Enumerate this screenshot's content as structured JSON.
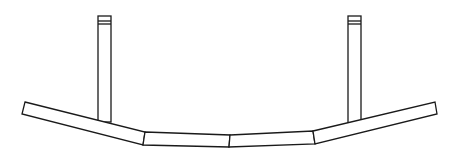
{
  "figure": {
    "stroke_color": "#1a1a1a",
    "background": "#ffffff",
    "segments": [
      {
        "name": "left-end-segment",
        "points": "25,102 145,132 143,145 22,114"
      },
      {
        "name": "center-left-segment",
        "points": "145,132 230,135 229,147 143,145"
      },
      {
        "name": "center-right-segment",
        "points": "230,135 313,131 315,144 229,147"
      },
      {
        "name": "right-end-segment",
        "points": "313,131 435,102 437,114 315,144"
      }
    ],
    "posts": [
      {
        "name": "left-post",
        "x": 98,
        "y": 16,
        "width": 13,
        "height": 106
      },
      {
        "name": "right-post",
        "x": 348,
        "y": 16,
        "width": 13,
        "height": 107
      }
    ]
  }
}
